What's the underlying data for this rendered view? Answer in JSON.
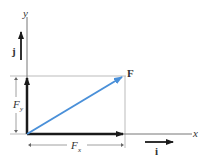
{
  "diagram": {
    "labels": {
      "x_axis": "x",
      "y_axis": "y",
      "vector": "F",
      "unit_i": "i",
      "unit_j": "j",
      "comp_x_main": "F",
      "comp_x_sub": "x",
      "comp_y_main": "F",
      "comp_y_sub": "y"
    },
    "colors": {
      "vector_F": "#4a90d9",
      "components": "#1a1a1a",
      "axes": "#555555",
      "guide_lines": "#bbbbbb"
    }
  }
}
